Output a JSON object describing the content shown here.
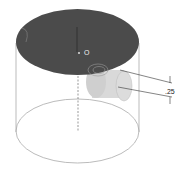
{
  "diagram": {
    "center_label": "O",
    "dimension_label": ".25",
    "colors": {
      "top_face": "#4a4a4a",
      "body_outline": "#9a9a9a",
      "boss_fill": "#d8d8d8",
      "dim_line": "#333333"
    }
  }
}
